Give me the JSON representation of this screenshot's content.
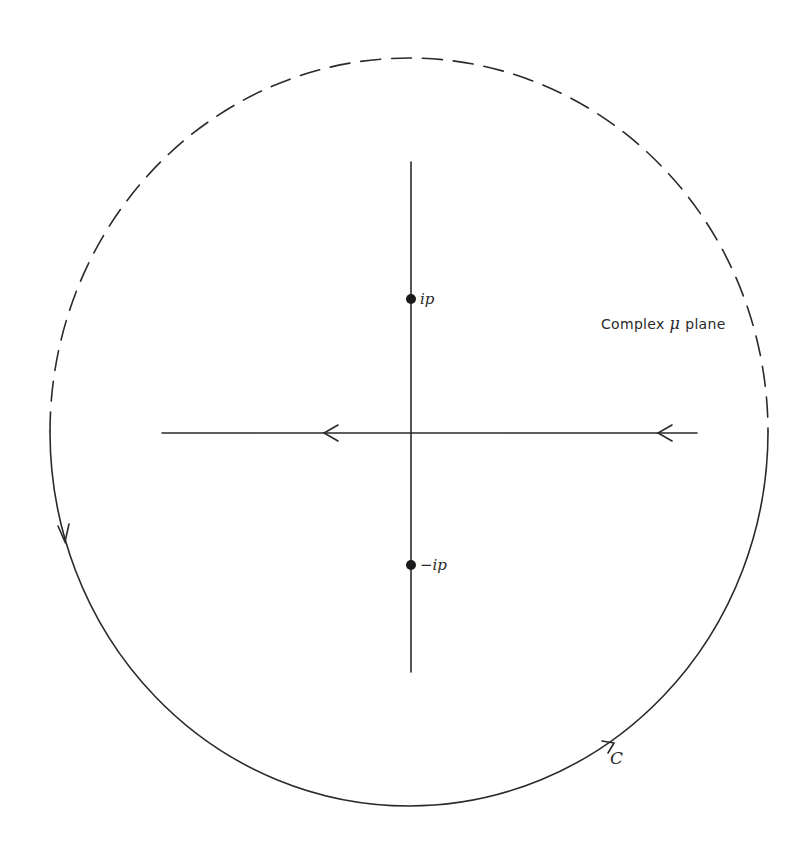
{
  "figure": {
    "plane_label": {
      "prefix": "Complex",
      "symbol": "μ",
      "suffix": "plane"
    },
    "poles": [
      {
        "label": "ip",
        "x": 411,
        "y": 299
      },
      {
        "label": "−ip",
        "x": 411,
        "y": 565
      }
    ],
    "contour": {
      "label": "C",
      "description": "Closed contour: real axis traversed right-to-left, closed by lower semicircle (solid) traversed counter-clockwise; upper semicircle shown dashed",
      "center": {
        "x": 409,
        "y": 432
      },
      "radius_x": 359,
      "radius_y": 374,
      "stroke_color": "#2a2a2a"
    },
    "axes": {
      "horizontal": {
        "x1": 162,
        "x2": 697,
        "y": 433,
        "arrow_direction": "left"
      },
      "vertical": {
        "x": 411,
        "y1": 162,
        "y2": 672
      }
    },
    "colors": {
      "background": "#ffffff",
      "ink": "#2a2a2a"
    }
  }
}
